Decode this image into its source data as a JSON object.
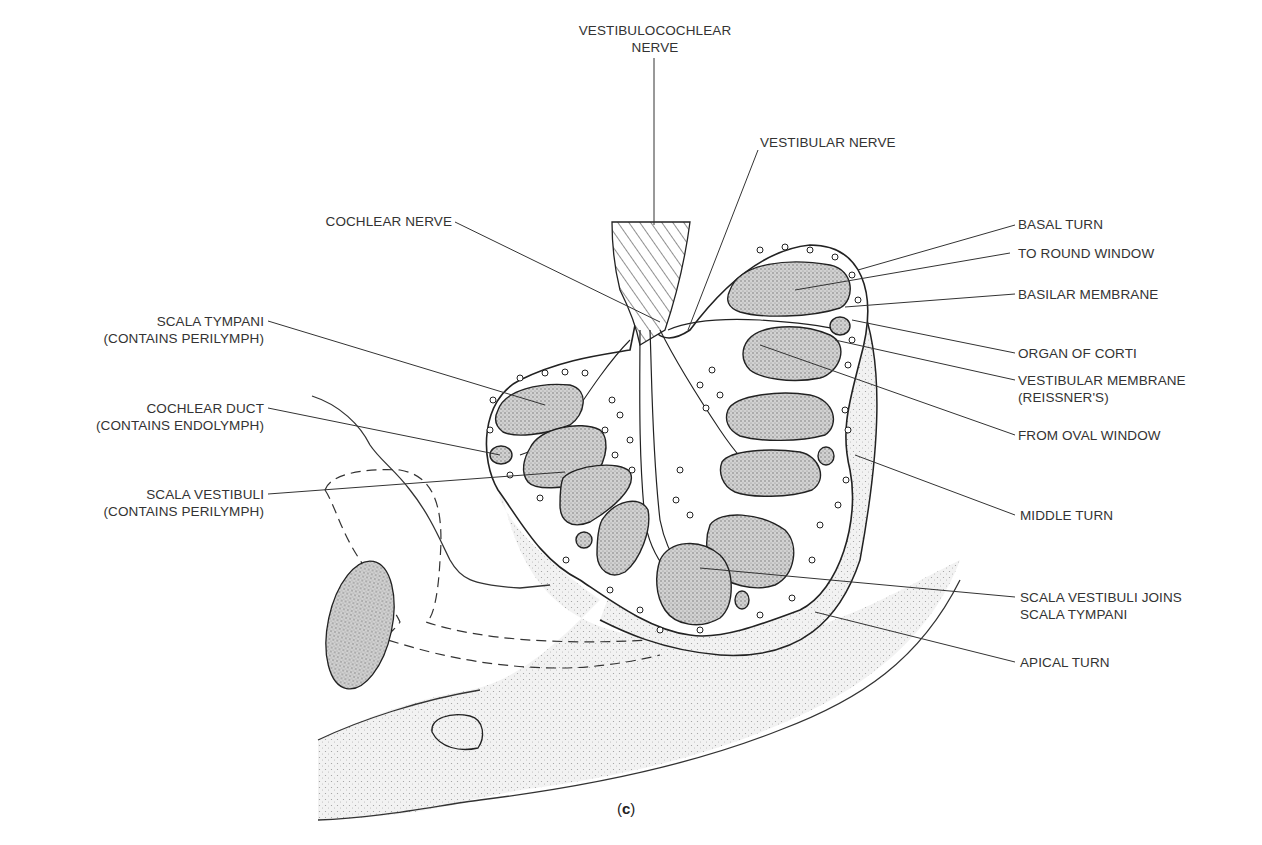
{
  "figure": {
    "caption_open": "(",
    "caption_letter": "c",
    "caption_close": ")"
  },
  "labels": {
    "vestibulocochlear_nerve": {
      "line1": "VESTIBULOCOCHLEAR",
      "line2": "NERVE"
    },
    "vestibular_nerve": {
      "line1": "VESTIBULAR NERVE"
    },
    "cochlear_nerve": {
      "line1": "COCHLEAR NERVE"
    },
    "basal_turn": {
      "line1": "BASAL TURN"
    },
    "to_round_window": {
      "line1": "TO ROUND WINDOW"
    },
    "basilar_membrane": {
      "line1": "BASILAR  MEMBRANE"
    },
    "organ_of_corti": {
      "line1": "ORGAN OF CORTI"
    },
    "vestibular_membrane": {
      "line1": "VESTIBULAR MEMBRANE",
      "line2": "(REISSNER'S)"
    },
    "from_oval_window": {
      "line1": "FROM OVAL WINDOW"
    },
    "middle_turn": {
      "line1": "MIDDLE TURN"
    },
    "scala_vestibuli_joins": {
      "line1": "SCALA VESTIBULI JOINS",
      "line2": "SCALA TYMPANI"
    },
    "apical_turn": {
      "line1": "APICAL TURN"
    },
    "scala_tympani": {
      "line1": "SCALA TYMPANI",
      "line2": "(CONTAINS PERILYMPH)"
    },
    "cochlear_duct": {
      "line1": "COCHLEAR DUCT",
      "line2": "(CONTAINS ENDOLYMPH)"
    },
    "scala_vestibuli": {
      "line1": "SCALA VESTIBULI",
      "line2": "(CONTAINS PERILYMPH)"
    }
  },
  "colors": {
    "ink": "#222222",
    "stipple_fill": "#c8c8c8",
    "light_stipple": "#e6e6e6",
    "bone_white": "#ffffff",
    "label_text": "#333333"
  }
}
